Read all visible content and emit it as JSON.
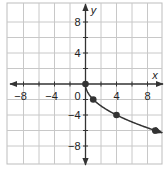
{
  "chart_data": {
    "type": "line",
    "title": "",
    "xlabel": "x",
    "ylabel": "y",
    "xlim": [
      -10,
      10
    ],
    "ylim": [
      -10,
      10
    ],
    "grid": true,
    "grid_step": 2,
    "x_ticks": [
      -8,
      -4,
      4,
      8
    ],
    "y_ticks": [
      8,
      4,
      -4,
      -8
    ],
    "origin_label": "0",
    "function": "y = -2*sqrt(x)",
    "series": [
      {
        "name": "curve",
        "x": [
          0,
          1,
          4,
          9
        ],
        "y": [
          0,
          -2,
          -4,
          -6
        ],
        "markers": true,
        "continues_with_arrow": true,
        "color": "#333333"
      }
    ],
    "legend": null
  },
  "style": {
    "grid_color": "#c8c8c8",
    "axis_color": "#333333",
    "curve_color": "#333333",
    "border_color": "#bdbdbd"
  }
}
